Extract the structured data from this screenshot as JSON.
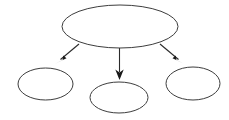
{
  "diagram": {
    "type": "node-link-hierarchy",
    "canvas": {
      "width": 229,
      "height": 120,
      "background_color": "#ffffff"
    },
    "style": {
      "node_stroke_color": "#3d3d3d",
      "node_fill_color": "#ffffff",
      "node_stroke_width": 1,
      "edge_stroke_color": "#2b2b2b",
      "edge_stroke_width": 1.1,
      "arrowhead_fill_color": "#1a1a1a"
    },
    "nodes": [
      {
        "id": "root",
        "label": "",
        "shape": "ellipse",
        "role": "parent",
        "cx": 120,
        "cy": 26.5,
        "rx": 58,
        "ry": 21.5
      },
      {
        "id": "child-left",
        "label": "",
        "shape": "ellipse",
        "role": "child",
        "cx": 45.5,
        "cy": 84,
        "rx": 27.5,
        "ry": 16
      },
      {
        "id": "child-middle",
        "label": "",
        "shape": "ellipse",
        "role": "child",
        "cx": 119,
        "cy": 97.5,
        "rx": 29,
        "ry": 15.5
      },
      {
        "id": "child-right",
        "label": "",
        "shape": "ellipse",
        "role": "child",
        "cx": 193,
        "cy": 83.5,
        "rx": 27,
        "ry": 16.5
      }
    ],
    "edges": [
      {
        "id": "edge-root-left",
        "from": "root",
        "to": "child-left",
        "direction": "down-left",
        "x1": 79,
        "y1": 44,
        "x2": 57,
        "y2": 63
      },
      {
        "id": "edge-root-middle",
        "from": "root",
        "to": "child-middle",
        "direction": "down",
        "x1": 119.5,
        "y1": 48,
        "x2": 119.5,
        "y2": 78
      },
      {
        "id": "edge-root-right",
        "from": "root",
        "to": "child-right",
        "direction": "down-right",
        "x1": 160,
        "y1": 44,
        "x2": 182,
        "y2": 63
      }
    ]
  }
}
